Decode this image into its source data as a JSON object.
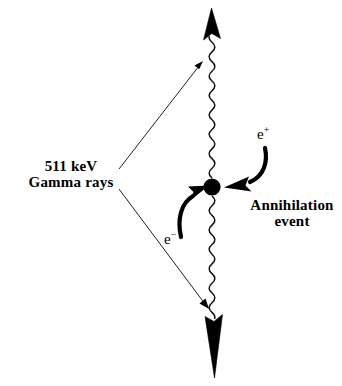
{
  "diagram": {
    "background_color": "#ffffff",
    "stroke_color": "#000000",
    "labels": {
      "gamma_line1": "511 keV",
      "gamma_line2": "Gamma rays",
      "annihilation_line1": "Annihilation",
      "annihilation_line2": "event",
      "positron": "e",
      "positron_charge": "+",
      "electron": "e",
      "electron_charge": "−"
    },
    "elements": {
      "annihilation_point": {
        "name": "annihilation-point-dot",
        "cx": 212,
        "cy": 187,
        "r": 8.5,
        "color": "#000000"
      },
      "photon_up": {
        "name": "gamma-ray-photon-up",
        "description": "wavy photon line travelling upward with solid arrowhead",
        "x": 212,
        "y_start": 178,
        "y_end": 30,
        "amplitude": 4.2,
        "wavelength": 13
      },
      "photon_down": {
        "name": "gamma-ray-photon-down",
        "description": "wavy photon line travelling downward with solid arrowhead",
        "x": 212,
        "y_start": 196,
        "y_end": 344,
        "amplitude": 4.2,
        "wavelength": 13
      },
      "pointer_upper": {
        "name": "gamma-label-pointer-upper",
        "from_x": 120,
        "from_y": 168,
        "to_x": 201,
        "to_y": 64
      },
      "pointer_lower": {
        "name": "gamma-label-pointer-lower",
        "from_x": 120,
        "from_y": 190,
        "to_x": 207,
        "to_y": 306
      },
      "electron_arrow": {
        "name": "electron-curved-arrow",
        "from_x": 181,
        "from_y": 237,
        "to_x": 205,
        "to_y": 186
      },
      "positron_arrow": {
        "name": "positron-curved-arrow",
        "from_x": 265,
        "from_y": 148,
        "to_x": 227,
        "to_y": 186
      }
    }
  }
}
